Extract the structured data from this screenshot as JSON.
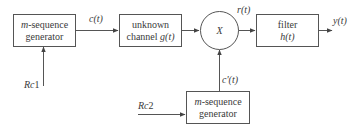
{
  "diagram": {
    "blocks": {
      "tx_generator": {
        "line1_italic": "m",
        "line1_rest": "-sequence",
        "line2": "generator"
      },
      "channel": {
        "line1": "unknown",
        "line2_text": "channel ",
        "line2_func": "g",
        "line2_arg": "(t)"
      },
      "multiplier": {
        "symbol": "X"
      },
      "filter": {
        "line1": "filter",
        "line2_func": "h",
        "line2_arg": "(t)"
      },
      "rx_generator": {
        "line1_italic": "m",
        "line1_rest": "-sequence",
        "line2": "generator"
      }
    },
    "signals": {
      "c": {
        "func": "c",
        "arg": "(t)"
      },
      "r": {
        "func": "r",
        "arg": "(t)"
      },
      "y": {
        "func": "y",
        "arg": "(t)"
      },
      "c_prime": {
        "func": "c'",
        "arg": "(t)"
      }
    },
    "inputs": {
      "rc1": {
        "italic": "Rc",
        "num": "1"
      },
      "rc2": {
        "italic": "Rc",
        "num": "2"
      }
    },
    "colors": {
      "line": "#555555",
      "text": "#3a3a3a",
      "background": "#ffffff"
    }
  }
}
